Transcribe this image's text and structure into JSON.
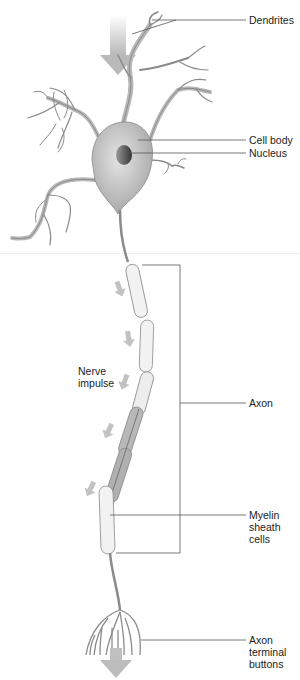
{
  "diagram": {
    "labels": {
      "dendrites": "Dendrites",
      "cell_body": "Cell body",
      "nucleus": "Nucleus",
      "nerve_impulse": "Nerve\nimpulse",
      "axon": "Axon",
      "myelin": "Myelin\nsheath\ncells",
      "terminal": "Axon\nterminal\nbuttons"
    },
    "colors": {
      "neuron_fill": "#c9c9c9",
      "neuron_stroke": "#7a7a7a",
      "myelin_fill": "#f2f2f2",
      "myelin_dark": "#a8a8a8",
      "arrow": "#bdbdbd",
      "leader_line": "#555555",
      "text": "#222222"
    }
  }
}
